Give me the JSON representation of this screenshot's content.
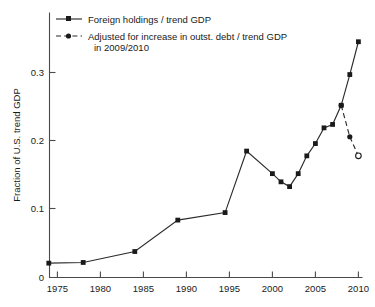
{
  "chart_data": {
    "type": "line",
    "title": "",
    "xlabel": "",
    "ylabel": "Fraction of U.S. trend GDP",
    "xlim": [
      1972.5,
      2011.5
    ],
    "ylim": [
      0,
      0.39
    ],
    "grid": false,
    "legend_position": "top-left",
    "xticks": [
      1975,
      1980,
      1985,
      1990,
      1995,
      2000,
      2005,
      2010
    ],
    "xticklabels": [
      "1975",
      "1980",
      "1985",
      "1990",
      "1995",
      "2000",
      "2005",
      "2010"
    ],
    "yticks": [
      0,
      0.1,
      0.2,
      0.3
    ],
    "yticklabels": [
      "0",
      "0.1",
      "0.2",
      "0.3"
    ],
    "series": [
      {
        "name": "Foreign holdings / trend GDP",
        "style": "solid",
        "marker": "filled-square",
        "color": "#2b2b2b",
        "x": [
          1974,
          1978,
          1984,
          1989,
          1994.5,
          1997,
          2000,
          2001,
          2002,
          2003,
          2004,
          2005,
          2006,
          2007,
          2008,
          2009,
          2010
        ],
        "y": [
          0.021,
          0.022,
          0.038,
          0.084,
          0.095,
          0.185,
          0.152,
          0.14,
          0.133,
          0.152,
          0.178,
          0.196,
          0.219,
          0.224,
          0.252,
          0.297,
          0.345
        ]
      },
      {
        "name": "Adjusted for increase in outst. debt / trend GDP in 2009/2010",
        "style": "dashed",
        "marker": "filled-circle-open-end",
        "color": "#2b2b2b",
        "x": [
          2008,
          2009,
          2010
        ],
        "y": [
          0.252,
          0.206,
          0.178
        ]
      }
    ]
  },
  "legend": {
    "entries": [
      {
        "label": "Foreign holdings / trend GDP",
        "line_style": "solid",
        "marker": "square"
      },
      {
        "label_line1": "Adjusted for increase in outst. debt / trend GDP",
        "label_line2": "in 2009/2010",
        "line_style": "dashed",
        "marker": "dot"
      }
    ]
  },
  "axis": {
    "y_title": "Fraction of U.S. trend GDP",
    "x_tick_0": "1975",
    "x_tick_1": "1980",
    "x_tick_2": "1985",
    "x_tick_3": "1990",
    "x_tick_4": "1995",
    "x_tick_5": "2000",
    "x_tick_6": "2005",
    "x_tick_7": "2010",
    "y_tick_0": "0",
    "y_tick_1": "0.1",
    "y_tick_2": "0.2",
    "y_tick_3": "0.3"
  },
  "colors": {
    "line": "#2b2b2b",
    "axis": "#4a4a4a",
    "background": "#ffffff",
    "text": "#1a1a1a"
  }
}
